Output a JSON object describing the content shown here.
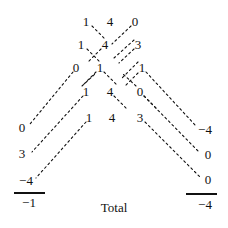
{
  "diagram": {
    "title_caption": "Total",
    "rows": [
      {
        "name": "row-1",
        "y": 21,
        "cells": [
          {
            "text": "1",
            "x": 86
          },
          {
            "text": "4",
            "x": 110
          },
          {
            "text": "0",
            "x": 135
          }
        ]
      },
      {
        "name": "row-2",
        "y": 44,
        "cells": [
          {
            "text": "1",
            "x": 81
          },
          {
            "text": "4",
            "x": 105
          },
          {
            "text": "3",
            "x": 138
          }
        ]
      },
      {
        "name": "row-3",
        "y": 67,
        "cells": [
          {
            "text": "0",
            "x": 76
          },
          {
            "text": "1",
            "x": 100
          },
          {
            "text": "1",
            "x": 142
          }
        ]
      },
      {
        "name": "row-4",
        "y": 91,
        "cells": [
          {
            "text": "1",
            "x": 86
          },
          {
            "text": "4",
            "x": 110
          },
          {
            "text": "0",
            "x": 140
          }
        ]
      },
      {
        "name": "row-5",
        "y": 117,
        "cells": [
          {
            "text": "1",
            "x": 89
          },
          {
            "text": "4",
            "x": 112
          },
          {
            "text": "3",
            "x": 140
          }
        ]
      }
    ],
    "left_column": {
      "name": "left-diagonal-sums",
      "values": [
        {
          "text": "0",
          "x": 22,
          "y": 127
        },
        {
          "text": "3",
          "x": 22,
          "y": 153
        },
        {
          "text": "−4",
          "x": 26,
          "y": 180
        }
      ],
      "rule": {
        "x": 14,
        "y": 192,
        "width": 31
      },
      "total": {
        "text": "−1",
        "x": 29,
        "y": 202
      }
    },
    "right_column": {
      "name": "right-diagonal-sums",
      "values": [
        {
          "text": "−4",
          "x": 205,
          "y": 129
        },
        {
          "text": "0",
          "x": 208,
          "y": 154
        },
        {
          "text": "0",
          "x": 208,
          "y": 179
        },
        {
          "text": "−4",
          "x": 205,
          "y": 204
        }
      ],
      "rule": {
        "x": 186,
        "y": 193,
        "width": 31
      }
    },
    "caption": {
      "text": "Total",
      "x": 114,
      "y": 207
    },
    "lines": [
      {
        "name": "dash-r1c1-down",
        "x1": 92,
        "y1": 26,
        "x2": 106,
        "y2": 40
      },
      {
        "name": "dash-r1c3-down",
        "x1": 131,
        "y1": 26,
        "x2": 112,
        "y2": 44
      },
      {
        "name": "dash-r2c1-down",
        "x1": 87,
        "y1": 49,
        "x2": 101,
        "y2": 63
      },
      {
        "name": "dash-r2c2-down",
        "x1": 101,
        "y1": 49,
        "x2": 88,
        "y2": 62
      },
      {
        "name": "dash-r2c3-up",
        "x1": 134,
        "y1": 40,
        "x2": 114,
        "y2": 58
      },
      {
        "name": "dash-r2c3-down",
        "x1": 134,
        "y1": 49,
        "x2": 119,
        "y2": 63
      },
      {
        "name": "dash-r3c2-down",
        "x1": 104,
        "y1": 72,
        "x2": 118,
        "y2": 86
      },
      {
        "name": "dash-r3c2-left",
        "x1": 96,
        "y1": 72,
        "x2": 83,
        "y2": 85
      },
      {
        "name": "dash-r3c3-up",
        "x1": 138,
        "y1": 62,
        "x2": 122,
        "y2": 78
      },
      {
        "name": "dash-r3c3-down",
        "x1": 138,
        "y1": 73,
        "x2": 124,
        "y2": 87
      },
      {
        "name": "dash-r4c1-up",
        "x1": 82,
        "y1": 86,
        "x2": 95,
        "y2": 74
      },
      {
        "name": "dash-r4c2-down",
        "x1": 114,
        "y1": 96,
        "x2": 127,
        "y2": 109
      },
      {
        "name": "dash-r4c3-up",
        "x1": 136,
        "y1": 86,
        "x2": 123,
        "y2": 74
      },
      {
        "name": "dash-r4c3-down",
        "x1": 144,
        "y1": 96,
        "x2": 157,
        "y2": 109
      },
      {
        "name": "fan-left-1",
        "x1": 73,
        "y1": 72,
        "x2": 30,
        "y2": 124
      },
      {
        "name": "fan-left-2",
        "x1": 83,
        "y1": 96,
        "x2": 32,
        "y2": 152
      },
      {
        "name": "fan-left-3",
        "x1": 86,
        "y1": 122,
        "x2": 36,
        "y2": 178
      },
      {
        "name": "fan-right-1",
        "x1": 146,
        "y1": 72,
        "x2": 196,
        "y2": 126
      },
      {
        "name": "fan-right-2",
        "x1": 144,
        "y1": 96,
        "x2": 199,
        "y2": 152
      },
      {
        "name": "fan-right-3",
        "x1": 145,
        "y1": 122,
        "x2": 200,
        "y2": 177
      }
    ]
  },
  "style": {
    "ink": "#111111",
    "background": "#ffffff",
    "dash_pattern": "2 3"
  }
}
